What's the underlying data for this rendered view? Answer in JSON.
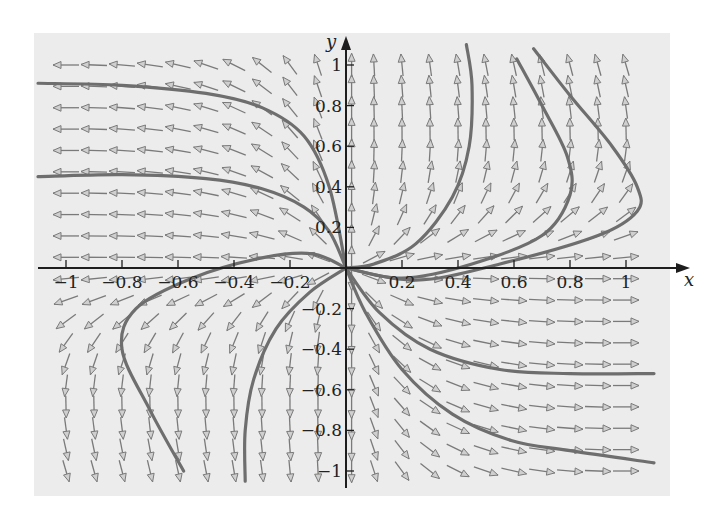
{
  "chart_data": {
    "type": "vector-field",
    "title": "",
    "xlabel": "x",
    "ylabel": "y",
    "xlim": [
      -1.1,
      1.1
    ],
    "ylim": [
      -1.05,
      1.05
    ],
    "grid": false,
    "x_ticks": [
      -1,
      -0.8,
      -0.6,
      -0.4,
      -0.2,
      0.2,
      0.4,
      0.6,
      0.8,
      1
    ],
    "x_tick_labels": [
      "−1",
      "−0.8",
      "−0.6",
      "−0.4",
      "−0.2",
      "0.2",
      "0.4",
      "0.6",
      "0.8",
      "1"
    ],
    "y_ticks": [
      -1,
      -0.8,
      -0.6,
      -0.4,
      -0.2,
      0.2,
      0.4,
      0.6,
      0.8,
      1
    ],
    "y_tick_labels": [
      "−1",
      "−0.8",
      "−0.6",
      "−0.4",
      "−0.2",
      "0.2",
      "0.4",
      "0.6",
      "0.8",
      "1"
    ],
    "field": {
      "description": "direction field, arrows on a regular grid",
      "x_range": [
        -1.0,
        1.0
      ],
      "y_range": [
        -1.0,
        1.0
      ],
      "nx": 21,
      "ny": 20,
      "arrow_length_px": 26
    },
    "trajectories": [
      {
        "name": "curve-upper-left-1",
        "points": [
          [
            -1.1,
            0.91
          ],
          [
            -0.8,
            0.9
          ],
          [
            -0.5,
            0.86
          ],
          [
            -0.3,
            0.79
          ],
          [
            -0.15,
            0.65
          ],
          [
            -0.06,
            0.4
          ],
          [
            0,
            0
          ]
        ]
      },
      {
        "name": "curve-upper-left-2",
        "points": [
          [
            -1.1,
            0.45
          ],
          [
            -0.8,
            0.46
          ],
          [
            -0.5,
            0.44
          ],
          [
            -0.3,
            0.39
          ],
          [
            -0.15,
            0.3
          ],
          [
            -0.06,
            0.18
          ],
          [
            0,
            0
          ]
        ]
      },
      {
        "name": "curve-left-low",
        "points": [
          [
            -0.58,
            -1.0
          ],
          [
            -0.7,
            -0.7
          ],
          [
            -0.8,
            -0.4
          ],
          [
            -0.75,
            -0.2
          ],
          [
            -0.55,
            -0.05
          ],
          [
            -0.3,
            0.05
          ],
          [
            -0.12,
            0.07
          ],
          [
            0,
            0
          ]
        ]
      },
      {
        "name": "curve-lower-left",
        "points": [
          [
            -0.36,
            -1.05
          ],
          [
            -0.36,
            -0.8
          ],
          [
            -0.33,
            -0.55
          ],
          [
            -0.25,
            -0.3
          ],
          [
            -0.13,
            -0.12
          ],
          [
            0,
            0
          ]
        ]
      },
      {
        "name": "curve-upper-right-1",
        "points": [
          [
            0.43,
            1.1
          ],
          [
            0.45,
            0.9
          ],
          [
            0.44,
            0.6
          ],
          [
            0.38,
            0.35
          ],
          [
            0.25,
            0.12
          ],
          [
            0.1,
            0.02
          ],
          [
            0,
            0
          ]
        ]
      },
      {
        "name": "curve-upper-right-2",
        "points": [
          [
            0.61,
            1.03
          ],
          [
            0.7,
            0.8
          ],
          [
            0.79,
            0.55
          ],
          [
            0.8,
            0.36
          ],
          [
            0.7,
            0.16
          ],
          [
            0.45,
            0.02
          ],
          [
            0.2,
            -0.05
          ],
          [
            0,
            0
          ]
        ]
      },
      {
        "name": "curve-upper-right-3",
        "points": [
          [
            0.67,
            1.08
          ],
          [
            0.8,
            0.85
          ],
          [
            0.95,
            0.6
          ],
          [
            1.04,
            0.4
          ],
          [
            1.04,
            0.28
          ],
          [
            0.9,
            0.16
          ],
          [
            0.55,
            0.02
          ],
          [
            0.25,
            -0.06
          ],
          [
            0,
            0
          ]
        ]
      },
      {
        "name": "curve-lower-right-1",
        "points": [
          [
            1.1,
            -0.52
          ],
          [
            0.8,
            -0.52
          ],
          [
            0.55,
            -0.5
          ],
          [
            0.3,
            -0.4
          ],
          [
            0.12,
            -0.22
          ],
          [
            0,
            0
          ]
        ]
      },
      {
        "name": "curve-lower-right-2",
        "points": [
          [
            1.1,
            -0.96
          ],
          [
            0.8,
            -0.9
          ],
          [
            0.59,
            -0.85
          ],
          [
            0.38,
            -0.72
          ],
          [
            0.2,
            -0.5
          ],
          [
            0.07,
            -0.22
          ],
          [
            0,
            0
          ]
        ]
      }
    ]
  },
  "axes": {
    "x_label": "x",
    "y_label": "y"
  },
  "colors": {
    "panel_bg": "#ececec",
    "arrow": "#7a7a7a",
    "curve": "#6e6e6e",
    "axis": "#1e1e1e"
  }
}
